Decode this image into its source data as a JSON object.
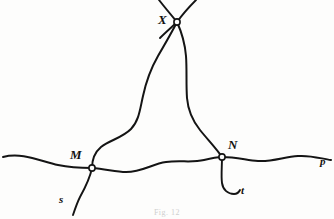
{
  "figure": {
    "caption": "Fig. 12",
    "background_color": "#fdfdfc",
    "ink_color": "#141414",
    "labels": {
      "X": "X",
      "M": "M",
      "N": "N",
      "p": "p",
      "s": "s",
      "t": "t"
    },
    "nodes": [
      {
        "id": "X",
        "label": "X",
        "x": 177,
        "y": 22,
        "marker": "open-circle"
      },
      {
        "id": "M",
        "label": "M",
        "x": 92,
        "y": 168,
        "marker": "open-circle"
      },
      {
        "id": "N",
        "label": "N",
        "x": 222,
        "y": 157,
        "marker": "open-circle"
      }
    ],
    "curves": [
      {
        "id": "horizontal-arc-p",
        "name": "base-curve-p",
        "endpoint_label": "p",
        "path": "M 3 157 C 22 152 40 161 58 165 C 72 168 82 168 92 168 C 106 169 116 172 126 172 C 142 172 152 164 166 162 C 180 160 192 163 204 160 C 212 158 216 157 222 157 C 236 157 246 160 258 161 C 272 162 284 157 298 156 C 312 155 322 159 331 160"
      },
      {
        "id": "left-loop-MX",
        "name": "loop-arc-m-to-x",
        "path": "M 92 168 C 92 160 94 153 101 147 C 110 140 122 138 131 129 C 139 121 140 109 143 96 C 146 82 150 70 158 56 C 165 44 172 32 177 22"
      },
      {
        "id": "right-loop-XN",
        "name": "loop-arc-x-to-n",
        "path": "M 177 22 C 182 33 185 44 186 56 C 187 70 186 84 187 98 C 188 110 192 120 200 130 C 208 140 216 148 222 157"
      },
      {
        "id": "upper-left-branch",
        "name": "branch-above-x-left",
        "path": "M 177 22 C 172 16 166 9 159 0"
      },
      {
        "id": "upper-right-branch",
        "name": "branch-above-x-right",
        "path": "M 177 22 C 182 15 188 8 196 0"
      },
      {
        "id": "crossing-left-tail",
        "name": "x-crossing-tail-lower-left",
        "path": "M 177 22 C 172 27 166 32 160 38"
      },
      {
        "id": "branch-s",
        "name": "branch-s-from-m",
        "endpoint_label": "s",
        "path": "M 92 168 C 90 178 85 188 80 197 C 77 203 75 209 73 215"
      },
      {
        "id": "branch-t",
        "name": "branch-t-from-n",
        "endpoint_label": "t",
        "path": "M 222 157 C 222 167 221 176 222 183 C 223 190 228 194 234 194 C 237 194 239 192 240 190"
      }
    ],
    "stroke_widths": {
      "main": 2.0,
      "branch": 1.9
    }
  }
}
